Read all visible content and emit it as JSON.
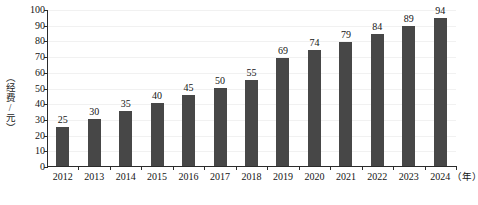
{
  "chart_data": {
    "type": "bar",
    "title": "",
    "subtitle": "",
    "xlabel": "（年）",
    "ylabel": "（经费/元）",
    "categories": [
      "2012",
      "2013",
      "2014",
      "2015",
      "2016",
      "2017",
      "2018",
      "2019",
      "2020",
      "2021",
      "2022",
      "2023",
      "2024"
    ],
    "values": [
      25,
      30,
      35,
      40,
      45,
      50,
      55,
      69,
      74,
      79,
      84,
      89,
      94
    ],
    "data_labels": [
      "25",
      "30",
      "35",
      "40",
      "45",
      "50",
      "55",
      "69",
      "74",
      "79",
      "84",
      "89",
      "94"
    ],
    "ylim": [
      0,
      100
    ],
    "ytick_labels": [
      "0",
      "10",
      "20",
      "30",
      "40",
      "50",
      "60",
      "70",
      "80",
      "90",
      "100"
    ],
    "ytick_values": [
      0,
      10,
      20,
      30,
      40,
      50,
      60,
      70,
      80,
      90,
      100
    ],
    "grid": "horizontal",
    "legend": "none",
    "series": [
      {
        "name": "经费",
        "values": [
          25,
          30,
          35,
          40,
          45,
          50,
          55,
          69,
          74,
          79,
          84,
          89,
          94
        ]
      }
    ],
    "colors": {
      "bar": "#474747",
      "axis": "#2b2b2b",
      "grid": "#f1f1f1",
      "text": "#141414",
      "background": "#ffffff"
    }
  }
}
